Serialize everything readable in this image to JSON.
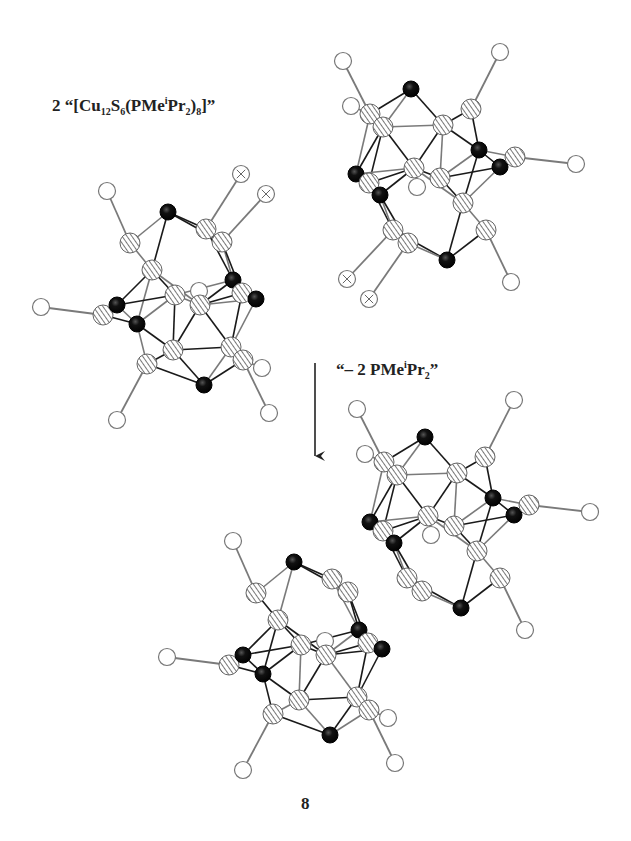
{
  "figure": {
    "reactant_label": {
      "coefficient": "2",
      "open_quote": "“[Cu",
      "sub1": "12",
      "s": "S",
      "sub2": "6",
      "ligand": "(PMe",
      "sup": "i",
      "ligand2": "Pr",
      "sub3": "2",
      "close": ")",
      "sub4": "8",
      "end": "]”"
    },
    "elimination_label": {
      "prefix": "“– 2 PMe",
      "sup": "i",
      "mid": "Pr",
      "sub": "2",
      "end": "”"
    },
    "compound_number": "8",
    "arrow": {
      "x": 315,
      "y1": 363,
      "y2": 456
    },
    "legend_styles": {
      "Cu": "hatched",
      "S": "black",
      "P": "open",
      "P_bridging": "crossed"
    },
    "colors": {
      "bond_dark": "#1a1a1a",
      "bond_light": "#7a7a7a",
      "sulfur": "#111111",
      "hatch": "#555555"
    },
    "clusters": [
      {
        "name": "left-monomer",
        "atoms": [
          {
            "t": "P",
            "x": 107,
            "y": 191
          },
          {
            "t": "S",
            "x": 168,
            "y": 212
          },
          {
            "t": "Cu",
            "x": 130,
            "y": 243
          },
          {
            "t": "Cu",
            "x": 206,
            "y": 229
          },
          {
            "t": "Cu",
            "x": 222,
            "y": 242
          },
          {
            "t": "X",
            "x": 241,
            "y": 174
          },
          {
            "t": "X",
            "x": 266,
            "y": 194
          },
          {
            "t": "Cu",
            "x": 152,
            "y": 270
          },
          {
            "t": "S",
            "x": 233,
            "y": 280
          },
          {
            "t": "P",
            "x": 199,
            "y": 291
          },
          {
            "t": "Cu",
            "x": 175,
            "y": 295
          },
          {
            "t": "Cu",
            "x": 200,
            "y": 305
          },
          {
            "t": "Cu",
            "x": 242,
            "y": 293
          },
          {
            "t": "S",
            "x": 256,
            "y": 299
          },
          {
            "t": "P",
            "x": 41,
            "y": 307
          },
          {
            "t": "Cu",
            "x": 103,
            "y": 315
          },
          {
            "t": "S",
            "x": 117,
            "y": 305
          },
          {
            "t": "S",
            "x": 137,
            "y": 324
          },
          {
            "t": "Cu",
            "x": 173,
            "y": 350
          },
          {
            "t": "Cu",
            "x": 147,
            "y": 364
          },
          {
            "t": "Cu",
            "x": 231,
            "y": 347
          },
          {
            "t": "Cu",
            "x": 243,
            "y": 360
          },
          {
            "t": "S",
            "x": 204,
            "y": 385
          },
          {
            "t": "P",
            "x": 262,
            "y": 368
          },
          {
            "t": "P",
            "x": 269,
            "y": 413
          },
          {
            "t": "P",
            "x": 117,
            "y": 420
          }
        ]
      },
      {
        "name": "right-monomer",
        "atoms": [
          {
            "t": "P",
            "x": 343,
            "y": 61
          },
          {
            "t": "P",
            "x": 351,
            "y": 106
          },
          {
            "t": "S",
            "x": 411,
            "y": 89
          },
          {
            "t": "Cu",
            "x": 370,
            "y": 114
          },
          {
            "t": "Cu",
            "x": 383,
            "y": 127
          },
          {
            "t": "Cu",
            "x": 443,
            "y": 125
          },
          {
            "t": "Cu",
            "x": 471,
            "y": 109
          },
          {
            "t": "P",
            "x": 500,
            "y": 52
          },
          {
            "t": "S",
            "x": 479,
            "y": 150
          },
          {
            "t": "S",
            "x": 500,
            "y": 167
          },
          {
            "t": "Cu",
            "x": 515,
            "y": 157
          },
          {
            "t": "P",
            "x": 576,
            "y": 164
          },
          {
            "t": "Cu",
            "x": 414,
            "y": 168
          },
          {
            "t": "Cu",
            "x": 440,
            "y": 178
          },
          {
            "t": "P",
            "x": 417,
            "y": 187
          },
          {
            "t": "S",
            "x": 356,
            "y": 174
          },
          {
            "t": "Cu",
            "x": 369,
            "y": 183
          },
          {
            "t": "S",
            "x": 380,
            "y": 195
          },
          {
            "t": "Cu",
            "x": 463,
            "y": 203
          },
          {
            "t": "Cu",
            "x": 393,
            "y": 230
          },
          {
            "t": "Cu",
            "x": 408,
            "y": 243
          },
          {
            "t": "Cu",
            "x": 486,
            "y": 230
          },
          {
            "t": "S",
            "x": 447,
            "y": 260
          },
          {
            "t": "X",
            "x": 347,
            "y": 279
          },
          {
            "t": "X",
            "x": 369,
            "y": 299
          },
          {
            "t": "P",
            "x": 511,
            "y": 282
          }
        ]
      }
    ],
    "dimer_offsets": [
      {
        "cluster": "left-monomer",
        "dx": 126,
        "dy": 350,
        "skip_types": [
          "X"
        ]
      },
      {
        "cluster": "right-monomer",
        "dx": 14,
        "dy": 348,
        "skip_types": [
          "X"
        ]
      }
    ]
  }
}
